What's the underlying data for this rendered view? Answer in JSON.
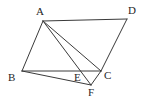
{
  "figure": {
    "background_color": "#ffffff",
    "stroke_color": "#3a3a3a",
    "label_color": "#262626",
    "stroke_width": 1,
    "canvas": {
      "width": 145,
      "height": 110
    }
  },
  "points": [
    {
      "id": "A",
      "label": "A",
      "x": 43,
      "y": 21,
      "label_x": 36,
      "label_y": 6
    },
    {
      "id": "B",
      "label": "B",
      "x": 22,
      "y": 71,
      "label_x": 8,
      "label_y": 72
    },
    {
      "id": "C",
      "label": "C",
      "x": 101,
      "y": 71,
      "label_x": 104,
      "label_y": 70
    },
    {
      "id": "D",
      "label": "D",
      "x": 127,
      "y": 19,
      "label_x": 128,
      "label_y": 5
    },
    {
      "id": "E",
      "label": "E",
      "x": 82,
      "y": 72,
      "label_x": 74,
      "label_y": 72
    },
    {
      "id": "F",
      "label": "F",
      "x": 91,
      "y": 85,
      "label_x": 88,
      "label_y": 87
    }
  ],
  "segments": [
    {
      "id": "AD",
      "from": "A",
      "to": "D",
      "name": "segment-ad"
    },
    {
      "id": "AB",
      "from": "A",
      "to": "B",
      "name": "segment-ab"
    },
    {
      "id": "DC",
      "from": "D",
      "to": "C",
      "name": "segment-dc"
    },
    {
      "id": "BC",
      "from": "B",
      "to": "C",
      "name": "segment-bc"
    },
    {
      "id": "AC",
      "from": "A",
      "to": "C",
      "name": "segment-ac"
    },
    {
      "id": "AF",
      "from": "A",
      "to": "F",
      "name": "segment-af"
    },
    {
      "id": "BF",
      "from": "B",
      "to": "F",
      "name": "segment-bf"
    },
    {
      "id": "CF",
      "from": "C",
      "to": "F",
      "name": "segment-cf"
    }
  ]
}
